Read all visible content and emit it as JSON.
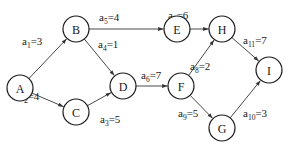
{
  "diagram": {
    "type": "activity-on-arrow network",
    "nodes": [
      {
        "id": "A",
        "label": "A",
        "x": 20,
        "y": 88
      },
      {
        "id": "B",
        "label": "B",
        "x": 76,
        "y": 29
      },
      {
        "id": "C",
        "label": "C",
        "x": 76,
        "y": 112
      },
      {
        "id": "D",
        "label": "D",
        "x": 123,
        "y": 86
      },
      {
        "id": "E",
        "label": "E",
        "x": 177,
        "y": 29
      },
      {
        "id": "F",
        "label": "F",
        "x": 181,
        "y": 86
      },
      {
        "id": "G",
        "label": "G",
        "x": 222,
        "y": 128
      },
      {
        "id": "H",
        "label": "H",
        "x": 222,
        "y": 29
      },
      {
        "id": "I",
        "label": "I",
        "x": 269,
        "y": 70
      }
    ],
    "edges": [
      {
        "name": "a",
        "sub": "1",
        "value": "=3",
        "from": "A",
        "to": "B",
        "lx": 22,
        "ly": 45
      },
      {
        "name": "a",
        "sub": "2",
        "value": "=4",
        "from": "A",
        "to": "C",
        "lx": 19,
        "ly": 100
      },
      {
        "name": "a",
        "sub": "3",
        "value": "=5",
        "from": "C",
        "to": "D",
        "lx": 100,
        "ly": 123
      },
      {
        "name": "a",
        "sub": "4",
        "value": "=1",
        "from": "B",
        "to": "D",
        "lx": 98,
        "ly": 48
      },
      {
        "name": "a",
        "sub": "5",
        "value": "=4",
        "from": "B",
        "to": "E",
        "lx": 99,
        "ly": 21
      },
      {
        "name": "a",
        "sub": "6",
        "value": "=7",
        "from": "D",
        "to": "F",
        "lx": 141,
        "ly": 79
      },
      {
        "name": "a",
        "sub": "7",
        "value": "=6",
        "from": "E",
        "to": "H",
        "lx": 168,
        "ly": 19
      },
      {
        "name": "a",
        "sub": "8",
        "value": "=2",
        "from": "F",
        "to": "H",
        "lx": 190,
        "ly": 70
      },
      {
        "name": "a",
        "sub": "9",
        "value": "=5",
        "from": "F",
        "to": "G",
        "lx": 178,
        "ly": 117
      },
      {
        "name": "a",
        "sub": "10",
        "value": "=3",
        "from": "G",
        "to": "I",
        "lx": 243,
        "ly": 117
      },
      {
        "name": "a",
        "sub": "11",
        "value": "=7",
        "from": "H",
        "to": "I",
        "lx": 243,
        "ly": 44
      }
    ],
    "node_radius": 13,
    "colors": {
      "stroke": "#1a1a1a",
      "edge": "#333333",
      "background": "#ffffff"
    }
  }
}
